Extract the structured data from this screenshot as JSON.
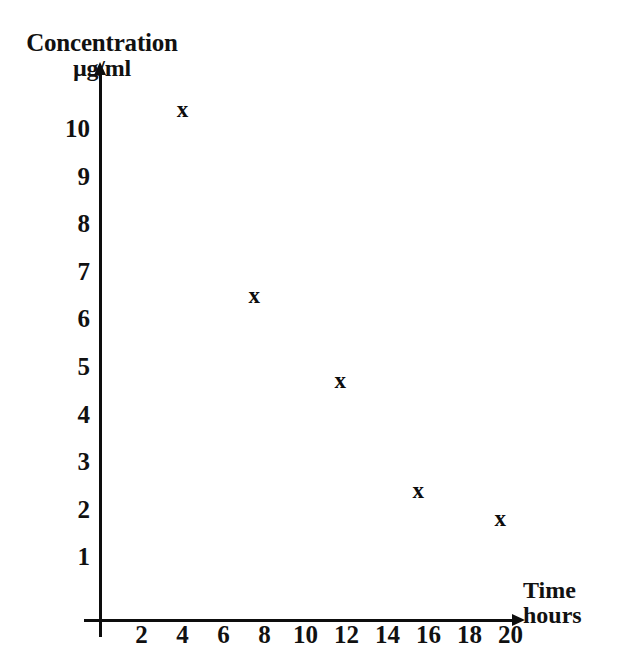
{
  "chart_data": {
    "type": "scatter",
    "title": "",
    "ylabel": "Concentration µg/ml",
    "ylabel_lines": [
      "Concentration",
      "µg/ml"
    ],
    "xlabel": "Time hours",
    "xlabel_lines": [
      "Time",
      "hours"
    ],
    "x": [
      4,
      7.5,
      11.7,
      15.5,
      19.5
    ],
    "y": [
      10.4,
      6.5,
      4.7,
      2.4,
      1.8
    ],
    "points": [
      {
        "x": 4,
        "y": 10.4,
        "marker": "x"
      },
      {
        "x": 7.5,
        "y": 6.5,
        "marker": "x"
      },
      {
        "x": 11.7,
        "y": 4.7,
        "marker": "x"
      },
      {
        "x": 15.5,
        "y": 2.4,
        "marker": "x"
      },
      {
        "x": 19.5,
        "y": 1.8,
        "marker": "x"
      }
    ],
    "marker_symbol": "x",
    "xlim": [
      0,
      21
    ],
    "ylim": [
      0,
      11
    ],
    "xticks": [
      2,
      4,
      6,
      8,
      10,
      12,
      14,
      16,
      18,
      20
    ],
    "xtick_labels": [
      "2",
      "4",
      "6",
      "8",
      "10",
      "12",
      "14",
      "16",
      "18",
      "20"
    ],
    "yticks": [
      1,
      2,
      3,
      4,
      5,
      6,
      7,
      8,
      9,
      10
    ],
    "ytick_labels": [
      "1",
      "2",
      "3",
      "4",
      "5",
      "6",
      "7",
      "8",
      "9",
      "10"
    ],
    "grid": false,
    "legend": null,
    "colors": {
      "axis": "#0d0d0d",
      "marker": "#0d0d0d",
      "background": "#ffffff"
    }
  },
  "axes": {
    "y_title_line1": "Concentration",
    "y_title_line2": "µg/ml",
    "x_title_line1": "Time",
    "x_title_line2": "hours"
  }
}
